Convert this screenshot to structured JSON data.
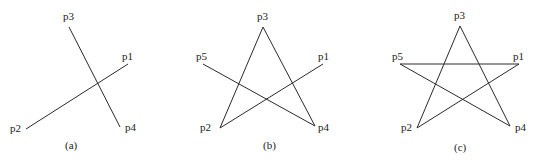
{
  "panels": [
    {
      "caption": "(a)",
      "points": {
        "p1": {
          "label": "p1",
          "x": 128,
          "y": 64
        },
        "p2": {
          "label": "p2",
          "x": 26,
          "y": 129
        },
        "p3": {
          "label": "p3",
          "x": 69,
          "y": 27
        },
        "p4": {
          "label": "p4",
          "x": 120,
          "y": 127
        }
      },
      "edges": [
        [
          "p2",
          "p1"
        ],
        [
          "p3",
          "p4"
        ]
      ]
    },
    {
      "caption": "(b)",
      "points": {
        "p1": {
          "label": "p1",
          "x": 323,
          "y": 64
        },
        "p2": {
          "label": "p2",
          "x": 220,
          "y": 128
        },
        "p3": {
          "label": "p3",
          "x": 263,
          "y": 27
        },
        "p4": {
          "label": "p4",
          "x": 315,
          "y": 126
        },
        "p5": {
          "label": "p5",
          "x": 203,
          "y": 64
        }
      },
      "edges": [
        [
          "p2",
          "p1"
        ],
        [
          "p3",
          "p4"
        ],
        [
          "p2",
          "p3"
        ],
        [
          "p5",
          "p4"
        ]
      ]
    },
    {
      "caption": "(c)",
      "points": {
        "p1": {
          "label": "p1",
          "x": 519,
          "y": 64
        },
        "p2": {
          "label": "p2",
          "x": 417,
          "y": 128
        },
        "p3": {
          "label": "p3",
          "x": 460,
          "y": 26
        },
        "p4": {
          "label": "p4",
          "x": 510,
          "y": 126
        },
        "p5": {
          "label": "p5",
          "x": 400,
          "y": 64
        }
      },
      "edges": [
        [
          "p2",
          "p1"
        ],
        [
          "p3",
          "p4"
        ],
        [
          "p2",
          "p3"
        ],
        [
          "p5",
          "p4"
        ],
        [
          "p5",
          "p1"
        ]
      ]
    }
  ]
}
